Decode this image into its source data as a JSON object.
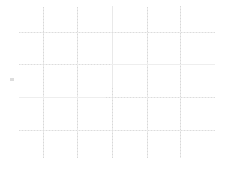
{
  "canvas": {
    "label": "faint-grid-canvas",
    "width": 227,
    "height": 169,
    "background_color": "#ffffff"
  },
  "colors": {
    "grid_solid_vertical": "#e9e9e9",
    "grid_solid_horizontal": "#eeeeee",
    "grid_dot_vertical": "#d8d8d8",
    "grid_dot_horizontal": "#dcdcdc",
    "tick_mark": "#dddddd"
  },
  "chart_data": {
    "type": "table",
    "title": "",
    "subtitle": "",
    "xlabel": "",
    "ylabel": "",
    "grid": true,
    "legend": null,
    "annotations": [],
    "series": [],
    "values": [],
    "categories": [],
    "grid_geometry": {
      "vertical_lines_x": [
        43,
        77,
        112,
        147,
        180
      ],
      "horizontal_lines_y": [
        32,
        64,
        97,
        130
      ],
      "vertical_line_top": 7,
      "vertical_line_bottom": 158,
      "horizontal_line_left": 19,
      "horizontal_line_right": 215,
      "cell_count_columns": 5,
      "cell_count_rows": 4
    }
  },
  "grid": {
    "vertical": [
      {
        "name": "vertical-gridline-1",
        "x": 43,
        "top": 7,
        "bottom": 158,
        "dotted_from": 7,
        "dotted_to": 158
      },
      {
        "name": "vertical-gridline-2",
        "x": 77,
        "top": 7,
        "bottom": 158,
        "dotted_from": 7,
        "dotted_to": 158
      },
      {
        "name": "vertical-gridline-3",
        "x": 112,
        "top": 6,
        "bottom": 158,
        "dotted_from": 88,
        "dotted_to": 158
      },
      {
        "name": "vertical-gridline-4",
        "x": 147,
        "top": 7,
        "bottom": 158,
        "dotted_from": 7,
        "dotted_to": 158
      },
      {
        "name": "vertical-gridline-5",
        "x": 180,
        "top": 6,
        "bottom": 158,
        "dotted_from": 6,
        "dotted_to": 158
      }
    ],
    "horizontal": [
      {
        "name": "horizontal-gridline-1",
        "y": 32,
        "left": 19,
        "right": 215,
        "dotted_from": 19,
        "dotted_to": 215
      },
      {
        "name": "horizontal-gridline-2",
        "y": 64,
        "left": 19,
        "right": 215,
        "dotted_from": 19,
        "dotted_to": 112
      },
      {
        "name": "horizontal-gridline-3",
        "y": 97,
        "left": 19,
        "right": 215,
        "dotted_from": 106,
        "dotted_to": 215
      },
      {
        "name": "horizontal-gridline-4",
        "y": 130,
        "left": 19,
        "right": 215,
        "dotted_from": 19,
        "dotted_to": 215
      }
    ]
  },
  "marks": {
    "left_tick": {
      "name": "axis-tick-mark",
      "x": 10,
      "y": 78,
      "width": 4,
      "height": 3
    }
  }
}
